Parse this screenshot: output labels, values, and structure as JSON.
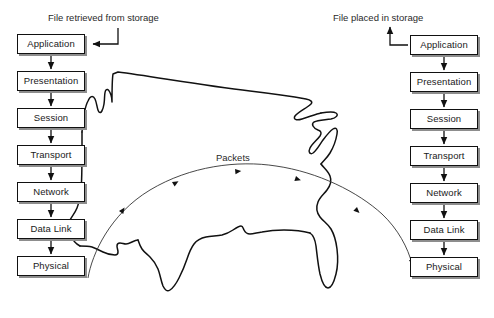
{
  "diagram": {
    "title_left": "File retrieved from storage",
    "title_right": "File placed in storage",
    "packets_label": "Packets",
    "background_color": "#ffffff",
    "line_color": "#111111",
    "box_border_color": "#111111",
    "box_shadow_color": "#8d8d8d",
    "text_color": "#1a1a1a"
  },
  "left_stack": {
    "name": "sender-osi-stack",
    "direction": "downward",
    "layers": [
      {
        "label": "Application"
      },
      {
        "label": "Presentation"
      },
      {
        "label": "Session"
      },
      {
        "label": "Transport"
      },
      {
        "label": "Network"
      },
      {
        "label": "Data Link"
      },
      {
        "label": "Physical"
      }
    ]
  },
  "right_stack": {
    "name": "receiver-osi-stack",
    "direction": "downward",
    "layers": [
      {
        "label": "Application"
      },
      {
        "label": "Presentation"
      },
      {
        "label": "Session"
      },
      {
        "label": "Transport"
      },
      {
        "label": "Network"
      },
      {
        "label": "Data Link"
      },
      {
        "label": "Physical"
      }
    ]
  },
  "map": {
    "name": "united-states-outline",
    "stroke": "#111111"
  }
}
